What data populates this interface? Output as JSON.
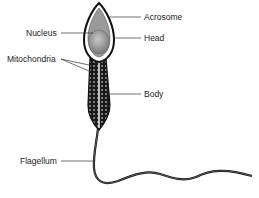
{
  "diagram": {
    "labels": {
      "nucleus": "Nucleus",
      "mitochondria": "Mitochondria",
      "acrosome": "Acrosome",
      "head": "Head",
      "body": "Body",
      "flagellum": "Flagellum"
    }
  }
}
